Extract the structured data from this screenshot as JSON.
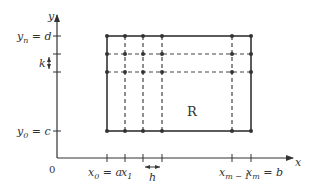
{
  "diagram": {
    "region_label": "R",
    "origin_label": "0",
    "axes": {
      "x_label": "x",
      "y_label": "y"
    },
    "x_ticks": [
      {
        "id": "x0",
        "label_main": "x",
        "label_sub": "0",
        "label_suffix": " = a"
      },
      {
        "id": "x1",
        "label_main": "x",
        "label_sub": "1",
        "label_suffix": ""
      },
      {
        "id": "x2",
        "label_main": "",
        "label_sub": "",
        "label_suffix": ""
      },
      {
        "id": "x3",
        "label_main": "",
        "label_sub": "",
        "label_suffix": ""
      },
      {
        "id": "xm1",
        "label_main": "x",
        "label_sub": "m − 1",
        "label_suffix": ""
      },
      {
        "id": "xm",
        "label_main": "x",
        "label_sub": "m",
        "label_suffix": " = b"
      }
    ],
    "y_ticks": [
      {
        "id": "y0",
        "label_main": "y",
        "label_sub": "0",
        "label_suffix": " = c"
      },
      {
        "id": "yn",
        "label_main": "y",
        "label_sub": "n",
        "label_suffix": " = d"
      }
    ],
    "spacing": {
      "h_label": "h",
      "k_label": "k"
    },
    "colors": {
      "line": "#333333",
      "background": "#ffffff"
    }
  }
}
